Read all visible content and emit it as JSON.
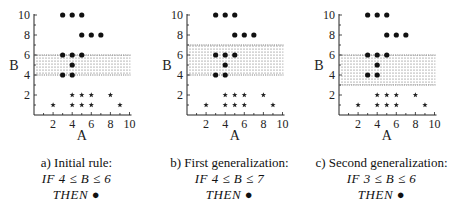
{
  "figure": {
    "panels": [
      {
        "id": "a",
        "title": "a) Initial rule:",
        "rule": "IF 4 ≤ B ≤ 6",
        "then": "THEN ●",
        "region": {
          "b_min": 4,
          "b_max": 6
        }
      },
      {
        "id": "b",
        "title": "b) First generalization:",
        "rule": "IF 4 ≤ B ≤ 7",
        "then": "THEN ●",
        "region": {
          "b_min": 4,
          "b_max": 7
        }
      },
      {
        "id": "c",
        "title": "c) Second generalization:",
        "rule": "IF 3 ≤ B ≤ 6",
        "then": "THEN ●",
        "region": {
          "b_min": 3,
          "b_max": 6
        }
      }
    ],
    "axes": {
      "x_label": "A",
      "y_label": "B",
      "x_ticks": [
        "2",
        "4",
        "6",
        "8",
        "10"
      ],
      "y_ticks": [
        "2",
        "4",
        "6",
        "8",
        "10"
      ]
    }
  },
  "chart_data": {
    "type": "scatter",
    "xlabel": "A",
    "ylabel": "B",
    "xlim": [
      0,
      10
    ],
    "ylim": [
      0,
      10
    ],
    "grid": false,
    "series": [
      {
        "name": "dot (positive class ●)",
        "marker": "circle",
        "points": [
          [
            3,
            10
          ],
          [
            4,
            10
          ],
          [
            5,
            10
          ],
          [
            5,
            8
          ],
          [
            6,
            8
          ],
          [
            7,
            8
          ],
          [
            3,
            6
          ],
          [
            4,
            6
          ],
          [
            5,
            6
          ],
          [
            4,
            5
          ],
          [
            3,
            4
          ],
          [
            4,
            4
          ]
        ]
      },
      {
        "name": "star (negative class ★)",
        "marker": "star",
        "points": [
          [
            4,
            2
          ],
          [
            5,
            2
          ],
          [
            6,
            2
          ],
          [
            8,
            2
          ],
          [
            2,
            1
          ],
          [
            4,
            1
          ],
          [
            5,
            1
          ],
          [
            6,
            1
          ],
          [
            9,
            1
          ]
        ]
      }
    ],
    "panels": [
      {
        "label": "a) Initial rule: IF 4 ≤ B ≤ 6 THEN ●",
        "shaded_band_B": [
          4,
          6
        ]
      },
      {
        "label": "b) First generalization: IF 4 ≤ B ≤ 7 THEN ●",
        "shaded_band_B": [
          4,
          7
        ]
      },
      {
        "label": "c) Second generalization: IF 3 ≤ B ≤ 6 THEN ●",
        "shaded_band_B": [
          3,
          6
        ]
      }
    ]
  }
}
